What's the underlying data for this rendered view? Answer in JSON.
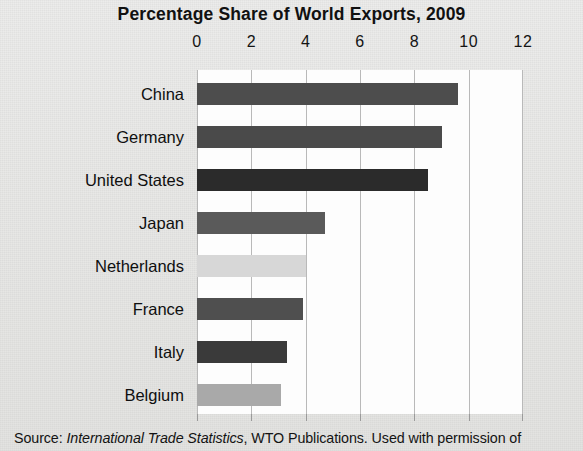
{
  "chart_data": {
    "type": "bar",
    "orientation": "horizontal",
    "title": "Percentage Share of World Exports, 2009",
    "xlabel": "",
    "ylabel": "",
    "xlim": [
      0,
      12
    ],
    "xticks": [
      0,
      2,
      4,
      6,
      8,
      10,
      12
    ],
    "xtick_labels": [
      "0",
      "2",
      "4",
      "6",
      "8",
      "10",
      "12"
    ],
    "grid": true,
    "legend": "none",
    "categories": [
      "China",
      "Germany",
      "United States",
      "Japan",
      "Netherlands",
      "France",
      "Italy",
      "Belgium"
    ],
    "values": [
      9.6,
      9.0,
      8.5,
      4.7,
      4.0,
      3.9,
      3.3,
      3.1
    ],
    "bar_colors": [
      "#4d4d4d",
      "#4a4a4a",
      "#2b2b2b",
      "#5a5a5a",
      "#d7d7d7",
      "#4f4f4f",
      "#3a3a3a",
      "#a9a9a9"
    ],
    "series": [
      {
        "name": "Percentage share of world exports, 2009",
        "values": [
          9.6,
          9.0,
          8.5,
          4.7,
          4.0,
          3.9,
          3.3,
          3.1
        ]
      }
    ]
  },
  "source": {
    "prefix": "Source:",
    "publication": "International Trade Statistics",
    "suffix": ", WTO Publications. Used with permission of"
  },
  "colors": {
    "page_background": "#e8e8e6",
    "plot_background": "#fdfdfd",
    "gridline": "#b9b9b9",
    "text": "#111111"
  }
}
